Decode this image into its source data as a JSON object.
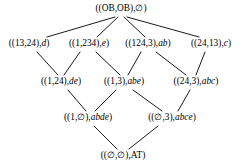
{
  "diagram": {
    "type": "hasse-lattice",
    "title_visible": false,
    "line_color": "#1a1a1a",
    "text_color": "#000000",
    "background": "#ffffff",
    "levels": [
      {
        "index": 0,
        "nodes": [
          {
            "id": "n0",
            "pair": "((OB,OB),",
            "tail": "∅",
            "tail_style": "upright",
            "close": ")",
            "label": "((OB,OB),∅)",
            "x": 121,
            "y": 9
          }
        ]
      },
      {
        "index": 1,
        "nodes": [
          {
            "id": "n1",
            "pair": "((13,24),",
            "tail": "d",
            "tail_style": "italic",
            "close": ")",
            "label": "((13,24),d)",
            "x": 29,
            "y": 44
          },
          {
            "id": "n2",
            "pair": "((1,234),",
            "tail": "e",
            "tail_style": "italic",
            "close": ")",
            "label": "((1,234),e)",
            "x": 89,
            "y": 44
          },
          {
            "id": "n3",
            "pair": "((124,3),",
            "tail": "ab",
            "tail_style": "italic",
            "close": ")",
            "label": "((124,3),ab)",
            "x": 148,
            "y": 44
          },
          {
            "id": "n4",
            "pair": "((24,13),",
            "tail": "c",
            "tail_style": "italic",
            "close": ")",
            "label": "((24,13),c)",
            "x": 211,
            "y": 44
          }
        ]
      },
      {
        "index": 2,
        "nodes": [
          {
            "id": "n5",
            "pair": "((1,24),",
            "tail": "de",
            "tail_style": "italic",
            "close": ")",
            "label": "((1,24),de)",
            "x": 61,
            "y": 82
          },
          {
            "id": "n6",
            "pair": "((1,3),",
            "tail": "abe",
            "tail_style": "italic",
            "close": ")",
            "label": "((1,3),abe)",
            "x": 124,
            "y": 82
          },
          {
            "id": "n7",
            "pair": "((24,3),",
            "tail": "abc",
            "tail_style": "italic",
            "close": ")",
            "label": "((24,3),abc)",
            "x": 196,
            "y": 82
          }
        ]
      },
      {
        "index": 3,
        "nodes": [
          {
            "id": "n8",
            "pair": "((1,∅),",
            "tail": "abde",
            "tail_style": "italic",
            "close": ")",
            "label": "((1,∅),abde)",
            "x": 88,
            "y": 118
          },
          {
            "id": "n9",
            "pair": "((∅,3),",
            "tail": "abce",
            "tail_style": "italic",
            "close": ")",
            "label": "((∅,3),abce)",
            "x": 172,
            "y": 118
          }
        ]
      },
      {
        "index": 4,
        "nodes": [
          {
            "id": "n10",
            "pair": "((∅,∅),",
            "tail": "AT",
            "tail_style": "upright",
            "close": ")",
            "label": "((∅,∅),AT)",
            "x": 123,
            "y": 156
          }
        ]
      }
    ],
    "edges": [
      {
        "from": "n0",
        "to": "n1",
        "x1": 115,
        "y1": 17,
        "x2": 47,
        "y2": 37
      },
      {
        "from": "n0",
        "to": "n2",
        "x1": 118,
        "y1": 17,
        "x2": 97,
        "y2": 37
      },
      {
        "from": "n0",
        "to": "n3",
        "x1": 124,
        "y1": 17,
        "x2": 145,
        "y2": 37
      },
      {
        "from": "n0",
        "to": "n4",
        "x1": 127,
        "y1": 17,
        "x2": 199,
        "y2": 37
      },
      {
        "from": "n1",
        "to": "n5",
        "x1": 37,
        "y1": 52,
        "x2": 58,
        "y2": 75
      },
      {
        "from": "n2",
        "to": "n5",
        "x1": 80,
        "y1": 52,
        "x2": 64,
        "y2": 75
      },
      {
        "from": "n2",
        "to": "n6",
        "x1": 96,
        "y1": 52,
        "x2": 120,
        "y2": 75
      },
      {
        "from": "n3",
        "to": "n6",
        "x1": 141,
        "y1": 52,
        "x2": 128,
        "y2": 75
      },
      {
        "from": "n3",
        "to": "n7",
        "x1": 156,
        "y1": 52,
        "x2": 186,
        "y2": 75
      },
      {
        "from": "n4",
        "to": "n7",
        "x1": 205,
        "y1": 52,
        "x2": 196,
        "y2": 75
      },
      {
        "from": "n5",
        "to": "n8",
        "x1": 68,
        "y1": 90,
        "x2": 86,
        "y2": 111
      },
      {
        "from": "n6",
        "to": "n8",
        "x1": 116,
        "y1": 90,
        "x2": 95,
        "y2": 111
      },
      {
        "from": "n6",
        "to": "n9",
        "x1": 133,
        "y1": 90,
        "x2": 162,
        "y2": 111
      },
      {
        "from": "n7",
        "to": "n9",
        "x1": 190,
        "y1": 90,
        "x2": 178,
        "y2": 111
      },
      {
        "from": "n8",
        "to": "n10",
        "x1": 94,
        "y1": 126,
        "x2": 117,
        "y2": 149
      },
      {
        "from": "n9",
        "to": "n10",
        "x1": 158,
        "y1": 126,
        "x2": 129,
        "y2": 149
      }
    ]
  }
}
